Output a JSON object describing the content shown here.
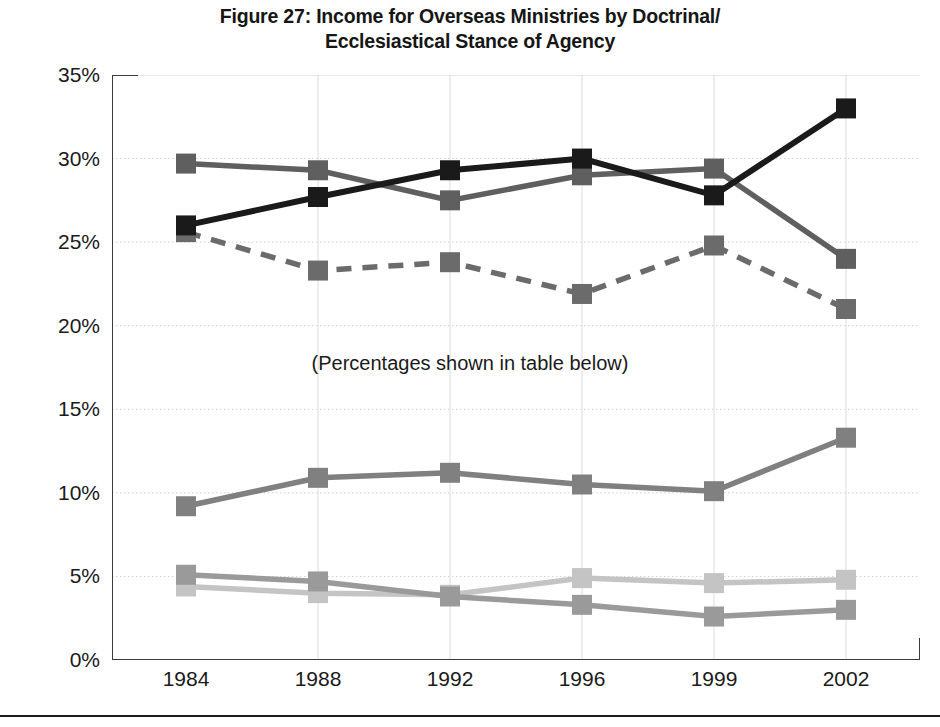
{
  "figure": {
    "title_line1": "Figure 27: Income for Overseas Ministries by Doctrinal/",
    "title_line2": "Ecclesiastical Stance of Agency",
    "annotation": "(Percentages shown in table below)"
  },
  "axis": {
    "y_ticks": [
      "0%",
      "5%",
      "10%",
      "15%",
      "20%",
      "25%",
      "30%",
      "35%"
    ],
    "x_ticks": [
      "1984",
      "1988",
      "1992",
      "1996",
      "1999",
      "2002"
    ]
  },
  "chart_data": {
    "type": "line",
    "title": "Figure 27: Income for Overseas Ministries by Doctrinal/ Ecclesiastical Stance of Agency",
    "xlabel": "",
    "ylabel": "",
    "categories": [
      "1984",
      "1988",
      "1992",
      "1996",
      "1999",
      "2002"
    ],
    "ylim": [
      0,
      35
    ],
    "ytick_values": [
      0,
      5,
      10,
      15,
      20,
      25,
      30,
      35
    ],
    "ytick_labels": [
      "0%",
      "5%",
      "10%",
      "15%",
      "20%",
      "25%",
      "30%",
      "35%"
    ],
    "grid": true,
    "grid_axis": "y",
    "legend": "none",
    "annotations": [
      "(Percentages shown in table below)"
    ],
    "value_unit": "percent",
    "series": [
      {
        "name": "series-1-black-solid",
        "color": "#1a1a1a",
        "line_style": "solid",
        "marker": "square",
        "values": [
          26.0,
          27.7,
          29.3,
          30.0,
          27.8,
          33.0
        ]
      },
      {
        "name": "series-2-darkgray-solid",
        "color": "#5f5f5f",
        "line_style": "solid",
        "marker": "square",
        "values": [
          29.7,
          29.3,
          27.5,
          29.0,
          29.4,
          24.0
        ]
      },
      {
        "name": "series-3-gray-dashed",
        "color": "#6b6b6b",
        "line_style": "dashed",
        "marker": "square",
        "values": [
          25.6,
          23.3,
          23.8,
          21.9,
          24.8,
          21.0
        ]
      },
      {
        "name": "series-4-midgray-solid",
        "color": "#808080",
        "line_style": "solid",
        "marker": "square",
        "values": [
          9.2,
          10.9,
          11.2,
          10.5,
          10.1,
          13.3
        ]
      },
      {
        "name": "series-5-gray-solid",
        "color": "#9a9a9a",
        "line_style": "solid",
        "marker": "square",
        "values": [
          5.1,
          4.7,
          3.8,
          3.3,
          2.6,
          3.0
        ]
      },
      {
        "name": "series-6-lightgray-solid",
        "color": "#c4c4c4",
        "line_style": "solid",
        "marker": "square",
        "values": [
          4.4,
          4.0,
          3.9,
          4.9,
          4.6,
          4.8
        ]
      }
    ]
  }
}
